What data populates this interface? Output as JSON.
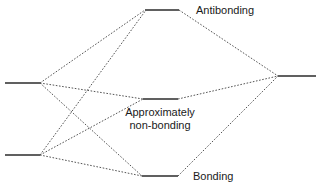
{
  "diagram": {
    "canvas": {
      "width": 318,
      "height": 186
    },
    "colors": {
      "level_stroke": "#606060",
      "correlation_stroke": "#555555",
      "label_text": "#1a1a1a",
      "background": "#ffffff"
    },
    "labels": {
      "antibonding": "Antibonding",
      "nonbonding_line1": "Approximately",
      "nonbonding_line2": "non-bonding",
      "bonding": "Bonding"
    },
    "levels": [
      {
        "id": "left-upper",
        "side": "left",
        "x1": 5,
        "x2": 40,
        "y": 83,
        "label": ""
      },
      {
        "id": "left-lower",
        "side": "left",
        "x1": 5,
        "x2": 40,
        "y": 155,
        "label": ""
      },
      {
        "id": "antibonding",
        "side": "center",
        "x1": 145,
        "x2": 179,
        "y": 10,
        "label": "Antibonding"
      },
      {
        "id": "nonbonding",
        "side": "center",
        "x1": 143,
        "x2": 178,
        "y": 99,
        "label": "Approximately non-bonding"
      },
      {
        "id": "bonding",
        "side": "center",
        "x1": 142,
        "x2": 178,
        "y": 176,
        "label": "Bonding"
      },
      {
        "id": "right",
        "side": "right",
        "x1": 278,
        "x2": 316,
        "y": 76,
        "label": ""
      }
    ],
    "correlations": [
      {
        "from": "left-upper",
        "to": "antibonding",
        "x1": 40,
        "y1": 83,
        "x2": 145,
        "y2": 10
      },
      {
        "from": "left-upper",
        "to": "nonbonding",
        "x1": 40,
        "y1": 83,
        "x2": 143,
        "y2": 99
      },
      {
        "from": "left-upper",
        "to": "bonding",
        "x1": 40,
        "y1": 83,
        "x2": 142,
        "y2": 176
      },
      {
        "from": "left-lower",
        "to": "antibonding",
        "x1": 40,
        "y1": 155,
        "x2": 146,
        "y2": 10
      },
      {
        "from": "left-lower",
        "to": "nonbonding",
        "x1": 40,
        "y1": 155,
        "x2": 143,
        "y2": 99
      },
      {
        "from": "left-lower",
        "to": "bonding",
        "x1": 40,
        "y1": 155,
        "x2": 142,
        "y2": 176
      },
      {
        "from": "antibonding",
        "to": "right",
        "x1": 179,
        "y1": 10,
        "x2": 278,
        "y2": 76
      },
      {
        "from": "nonbonding",
        "to": "right",
        "x1": 178,
        "y1": 99,
        "x2": 278,
        "y2": 76
      },
      {
        "from": "bonding",
        "to": "right",
        "x1": 178,
        "y1": 176,
        "x2": 278,
        "y2": 76
      }
    ],
    "label_positions": {
      "antibonding": {
        "x": 196,
        "y": 14
      },
      "nonbonding_line1": {
        "x": 160,
        "y": 116
      },
      "nonbonding_line2": {
        "x": 160,
        "y": 129
      },
      "bonding": {
        "x": 193,
        "y": 180
      }
    }
  }
}
